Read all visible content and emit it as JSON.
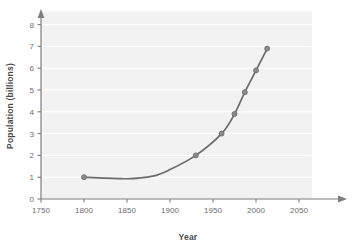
{
  "chart_data": {
    "type": "line",
    "title": "",
    "xlabel": "Year",
    "ylabel": "Population (billions)",
    "xlim": [
      1750,
      2065
    ],
    "ylim": [
      0,
      8.6
    ],
    "xticks": [
      1750,
      1800,
      1850,
      1900,
      1950,
      2000,
      2050
    ],
    "yticks": [
      0,
      1,
      2,
      3,
      4,
      5,
      6,
      7,
      8
    ],
    "grid": "horizontal-white",
    "legend": "none",
    "series": [
      {
        "name": "World population",
        "color": "#6b6b6b",
        "marker": "circle",
        "points": [
          {
            "x": 1800,
            "y": 1.0
          },
          {
            "x": 1930,
            "y": 2.0
          },
          {
            "x": 1960,
            "y": 3.0
          },
          {
            "x": 1975,
            "y": 3.9
          },
          {
            "x": 1987,
            "y": 4.9
          },
          {
            "x": 2000,
            "y": 5.9
          },
          {
            "x": 2013,
            "y": 6.9
          }
        ],
        "curve_control_points": [
          {
            "x": 1800,
            "y": 1.0
          },
          {
            "x": 1850,
            "y": 0.93
          },
          {
            "x": 1880,
            "y": 1.05
          },
          {
            "x": 1900,
            "y": 1.35
          },
          {
            "x": 1930,
            "y": 2.0
          },
          {
            "x": 1960,
            "y": 3.0
          },
          {
            "x": 1975,
            "y": 3.9
          },
          {
            "x": 1987,
            "y": 4.9
          },
          {
            "x": 2000,
            "y": 5.9
          },
          {
            "x": 2013,
            "y": 6.9
          }
        ]
      }
    ]
  },
  "axes": {
    "x_tick_labels": [
      "1750",
      "1800",
      "1850",
      "1900",
      "1950",
      "2000",
      "2050"
    ],
    "y_tick_labels": [
      "0",
      "1",
      "2",
      "3",
      "4",
      "5",
      "6",
      "7",
      "8"
    ],
    "x_axis_title": "Year",
    "y_axis_title": "Population (billions)"
  },
  "style": {
    "plot_background": "#f2f2f2",
    "gridline_color": "#ffffff",
    "axis_color": "#7d7d7d",
    "line_color": "#6b6b6b",
    "marker_color": "#8a8a8a",
    "tick_label_color": "#6d6d6d",
    "title_color": "#4a4a4a",
    "page_background": "#ffffff"
  }
}
